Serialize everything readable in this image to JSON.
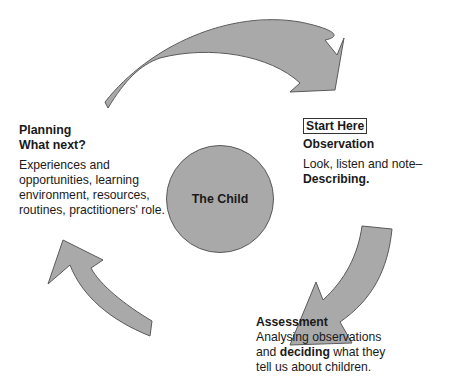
{
  "diagram": {
    "center": {
      "label": "The Child"
    },
    "planning": {
      "title_line1": "Planning",
      "title_line2": "What next?",
      "body_lines": [
        "Experiences and",
        "opportunities, learning",
        "environment, resources,",
        "routines, practitioners' role."
      ]
    },
    "observation": {
      "start_label": "Start Here",
      "title": "Observation",
      "body_line1": "Look, listen and note–",
      "body_line2_bold": "Describing."
    },
    "assessment": {
      "title": "Assessment",
      "line1": "Analysing observations",
      "line2_pre": "and ",
      "line2_bold": "deciding",
      "line2_post": " what they",
      "line3": "tell us about children."
    },
    "colors": {
      "arrow_fill": "#a9a9a9",
      "arrow_stroke": "#5a5a5a",
      "circle_fill": "#a9a9a9"
    }
  }
}
